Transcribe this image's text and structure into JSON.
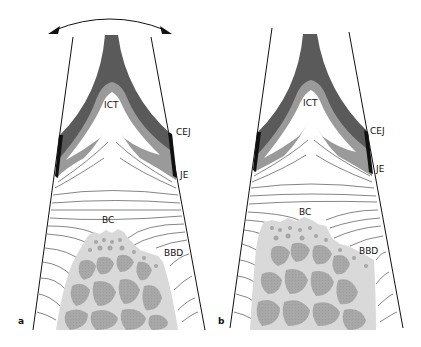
{
  "figure": {
    "panels": [
      {
        "id": "a",
        "label": "a",
        "annotations": {
          "ict": "ICT",
          "cej": "CEJ",
          "je": "JE",
          "bc": "BC",
          "bbd": "BBD"
        },
        "has_rotation_arrow": true
      },
      {
        "id": "b",
        "label": "b",
        "annotations": {
          "ict": "ICT",
          "cej": "CEJ",
          "je": "JE",
          "bc": "BC",
          "bbd": "BBD"
        },
        "has_rotation_arrow": false
      }
    ],
    "colors": {
      "dark_tissue": "#5a5a5a",
      "mid_tissue": "#9a9a9a",
      "light_bone": "#d9d9d9",
      "marrow": "#a8a8a8",
      "outline": "#111111",
      "fiber": "#333333"
    }
  }
}
